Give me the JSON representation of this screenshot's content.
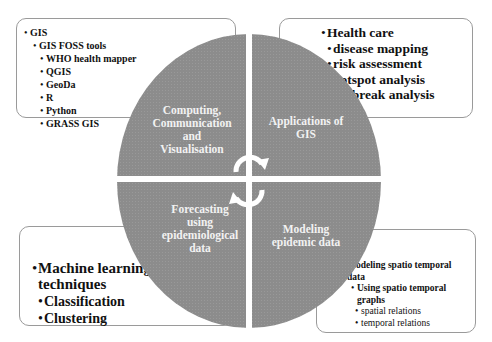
{
  "colors": {
    "circle": "#8c8c8c",
    "divider": "#ffffff",
    "box_border": "#9a9a9a",
    "text": "#111111",
    "quadrant_text": "#f2f2f2"
  },
  "quadrants": {
    "top_left": {
      "label_lines": [
        "Computing,",
        "Communication",
        "and",
        "Visualisation"
      ]
    },
    "top_right": {
      "label_lines": [
        "Applications of",
        "GIS"
      ]
    },
    "bottom_left": {
      "label_lines": [
        "Forecasting",
        "using",
        "epidemiological",
        "data"
      ]
    },
    "bottom_right": {
      "label_lines": [
        "Modeling",
        "epidemic data"
      ]
    }
  },
  "center_icon": "cycle-arrows-icon",
  "boxes": {
    "top_left": {
      "items": [
        {
          "text": "GIS",
          "level": 0
        },
        {
          "text": "GIS FOSS tools",
          "level": 1
        },
        {
          "text": "WHO health mapper",
          "level": 2
        },
        {
          "text": "QGIS",
          "level": 2
        },
        {
          "text": "GeoDa",
          "level": 2
        },
        {
          "text": "R",
          "level": 2
        },
        {
          "text": "Python",
          "level": 2
        },
        {
          "text": "GRASS GIS",
          "level": 2
        }
      ]
    },
    "top_right": {
      "items": [
        {
          "text": "Health care",
          "level": 0
        },
        {
          "text": "disease mapping",
          "level": 1
        },
        {
          "text": "risk assessment",
          "level": 1
        },
        {
          "text": "hotspot analysis",
          "level": 1
        },
        {
          "text": "outbreak analysis",
          "level": 1
        }
      ]
    },
    "bottom_left": {
      "items": [
        {
          "text": "Machine learning",
          "level": 0
        },
        {
          "text": "techniques",
          "level": 0
        },
        {
          "text": "Classification",
          "level": 1
        },
        {
          "text": "Clustering",
          "level": 1
        }
      ]
    },
    "bottom_right": {
      "items": [
        {
          "text": "Modeling spatio temporal",
          "level": 0
        },
        {
          "text": "data",
          "level": 0
        },
        {
          "text": "Using spatio temporal",
          "level": 1
        },
        {
          "text": "graphs",
          "level": 1
        },
        {
          "text": "spatial relations",
          "level": 2
        },
        {
          "text": "temporal relations",
          "level": 2
        }
      ]
    }
  }
}
